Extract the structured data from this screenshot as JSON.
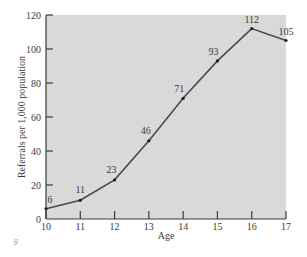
{
  "chart_data": {
    "type": "line",
    "title": "",
    "xlabel": "Age",
    "ylabel": "Referrals per 1,000 population",
    "x": [
      10,
      11,
      12,
      13,
      14,
      15,
      16,
      17
    ],
    "series": [
      {
        "name": "Referrals per 1,000 population",
        "values": [
          6,
          11,
          23,
          46,
          71,
          93,
          112,
          105
        ]
      }
    ],
    "data_labels": [
      "6",
      "11",
      "23",
      "46",
      "71",
      "93",
      "112",
      "105"
    ],
    "xlim": [
      10,
      17
    ],
    "ylim": [
      0,
      120
    ],
    "x_ticks": [
      "10",
      "11",
      "12",
      "13",
      "14",
      "15",
      "16",
      "17"
    ],
    "y_ticks": [
      "0",
      "20",
      "40",
      "60",
      "80",
      "100",
      "120"
    ],
    "grid": false,
    "legend": "none",
    "annotations": [
      "g"
    ]
  },
  "colors": {
    "plot_background": "#d9d9d9",
    "line": "#4a4a4a",
    "axis": "#3a3a3a",
    "text": "#3a3a3a"
  }
}
